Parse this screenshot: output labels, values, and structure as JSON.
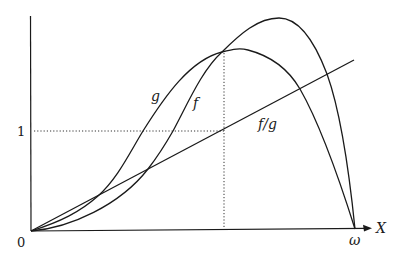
{
  "diagram": {
    "type": "function-plot",
    "axes": {
      "x_label": "X",
      "origin_label": "0",
      "y_tick_label": "1",
      "x_end_label": "ω"
    },
    "curves": [
      {
        "name": "g",
        "label": "g",
        "description": "curve rising from origin, peaking near the dotted line, returning to zero at ω"
      },
      {
        "name": "f",
        "label": "f",
        "description": "curve rising from origin, higher peak right of dotted line, returning to zero at ω"
      },
      {
        "name": "f_over_g",
        "label": "f/g",
        "description": "straight line increasing from origin"
      }
    ],
    "guides": {
      "horizontal_dotted_at": "1",
      "vertical_dotted_at": "intersection of f and g"
    }
  }
}
